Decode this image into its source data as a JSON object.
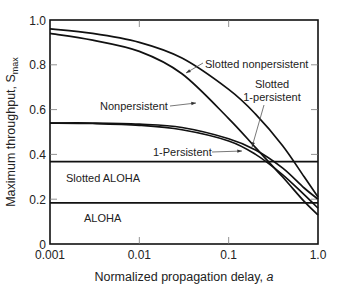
{
  "chart_data": {
    "type": "line",
    "title": "",
    "xlabel": "Normalized propagation delay, a",
    "ylabel": "Maximum throughput, S_max",
    "ylabel_main": "Maximum throughput, S",
    "ylabel_sub": "max",
    "xlabel_main": "Normalized propagation delay, ",
    "xlabel_italic": "a",
    "xscale": "log",
    "xlim": [
      0.001,
      1.0
    ],
    "ylim": [
      0,
      1.0
    ],
    "x_ticks": [
      0.001,
      0.01,
      0.1,
      1.0
    ],
    "x_tick_labels": [
      "0.001",
      "0.01",
      "0.1",
      "1.0"
    ],
    "y_ticks": [
      0,
      0.2,
      0.4,
      0.6,
      0.8,
      1.0
    ],
    "y_tick_labels": [
      "0",
      "0.2",
      "0.4",
      "0.6",
      "0.8",
      "1.0"
    ],
    "grid": false,
    "legend": "inline annotations",
    "series": [
      {
        "name": "Slotted nonpersistent",
        "x": [
          0.001,
          0.003,
          0.01,
          0.03,
          0.1,
          0.2,
          0.4,
          0.7,
          1.0
        ],
        "y": [
          0.96,
          0.94,
          0.9,
          0.83,
          0.69,
          0.58,
          0.44,
          0.3,
          0.21
        ]
      },
      {
        "name": "Nonpersistent",
        "x": [
          0.001,
          0.003,
          0.01,
          0.03,
          0.1,
          0.2,
          0.4,
          0.7,
          1.0
        ],
        "y": [
          0.94,
          0.91,
          0.86,
          0.76,
          0.56,
          0.43,
          0.3,
          0.19,
          0.13
        ]
      },
      {
        "name": "Slotted 1-persistent",
        "x": [
          0.001,
          0.003,
          0.01,
          0.03,
          0.1,
          0.2,
          0.4,
          0.7,
          1.0
        ],
        "y": [
          0.54,
          0.54,
          0.535,
          0.52,
          0.47,
          0.42,
          0.34,
          0.25,
          0.2
        ]
      },
      {
        "name": "1-Persistent",
        "x": [
          0.001,
          0.003,
          0.01,
          0.03,
          0.1,
          0.2,
          0.4,
          0.7,
          1.0
        ],
        "y": [
          0.54,
          0.538,
          0.53,
          0.51,
          0.46,
          0.4,
          0.31,
          0.22,
          0.16
        ]
      },
      {
        "name": "Slotted ALOHA",
        "x": [
          0.001,
          1.0
        ],
        "y": [
          0.368,
          0.368
        ]
      },
      {
        "name": "ALOHA",
        "x": [
          0.001,
          1.0
        ],
        "y": [
          0.184,
          0.184
        ]
      }
    ],
    "annotations": [
      {
        "text": "Slotted nonpersistent",
        "arrow_to_series": "Slotted nonpersistent"
      },
      {
        "text": "Nonpersistent",
        "arrow_to_series": "Nonpersistent"
      },
      {
        "text": "Slotted",
        "text2": "1-persistent",
        "arrow_to_series": "Slotted 1-persistent"
      },
      {
        "text": "1-Persistent",
        "arrow_to_series": "1-Persistent"
      },
      {
        "text": "Slotted ALOHA",
        "label_for_series": "Slotted ALOHA"
      },
      {
        "text": "ALOHA",
        "label_for_series": "ALOHA"
      }
    ],
    "colors": {
      "line": "#111111",
      "axis": "#111111",
      "text": "#222222",
      "background": "#ffffff"
    }
  }
}
